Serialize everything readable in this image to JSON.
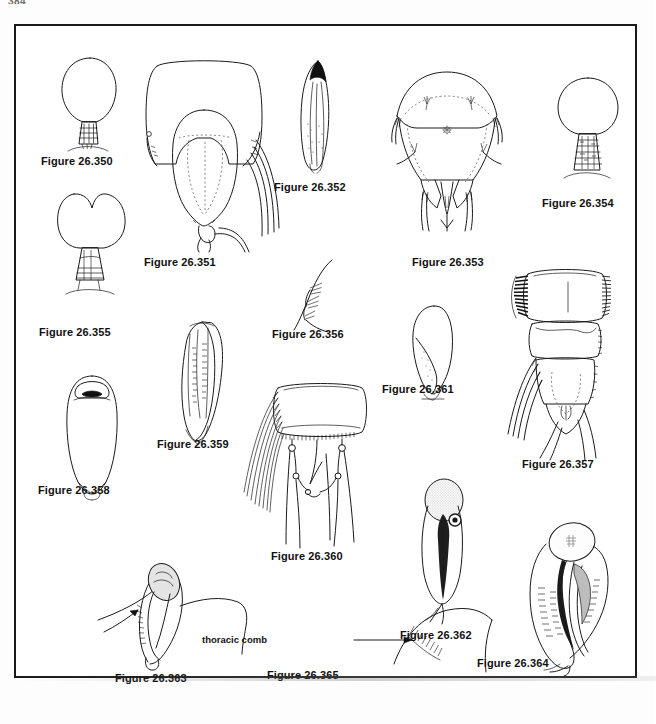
{
  "page": {
    "folio": "384",
    "background_color": "#ffffff",
    "frame_color": "#1a1a1a",
    "ink_color": "#1a1a1a"
  },
  "plate": {
    "type": "scientific-figure-plate",
    "subject": "insect (mosquito) anatomical line drawings",
    "figure_count": 16,
    "figures": [
      {
        "id": "26.350",
        "caption": "Figure 26.350",
        "subject": "stippled pyriform scale with banded stalk"
      },
      {
        "id": "26.351",
        "caption": "Figure 26.351",
        "subject": "terminal abdominal segments with cercal setae"
      },
      {
        "id": "26.352",
        "caption": "Figure 26.352",
        "subject": "elongate lanceolate appendage with dark apex"
      },
      {
        "id": "26.353",
        "caption": "Figure 26.353",
        "subject": "broad terminal plate with paired spines"
      },
      {
        "id": "26.354",
        "caption": "Figure 26.354",
        "subject": "globose stippled head on annulate stalk"
      },
      {
        "id": "26.355",
        "caption": "Figure 26.355",
        "subject": "bilobed (heart-shaped) stippled structure on stalk"
      },
      {
        "id": "26.356",
        "caption": "Figure 26.356",
        "subject": "marginal setal comb detail"
      },
      {
        "id": "26.357",
        "caption": "Figure 26.357",
        "subject": "abdominal segments with lateral comb and caudal setae"
      },
      {
        "id": "26.358",
        "caption": "Figure 26.358",
        "subject": "elongate ovoid body with dark apical cap"
      },
      {
        "id": "26.359",
        "caption": "Figure 26.359",
        "subject": "curved sclerotized plate with internal markings"
      },
      {
        "id": "26.360",
        "caption": "Figure 26.360",
        "subject": "terminal segment with long lateral setal fringe"
      },
      {
        "id": "26.361",
        "caption": "Figure 26.361",
        "subject": "paddle-shaped appendage"
      },
      {
        "id": "26.362",
        "caption": "Figure 26.362",
        "subject": "pupal stage with stippled cephalothorax"
      },
      {
        "id": "26.363",
        "caption": "Figure 26.363",
        "subject": "lateral view of pupa on substrate"
      },
      {
        "id": "26.364",
        "caption": "Figure 26.364",
        "subject": "curved stippled pupa with dark trunk"
      },
      {
        "id": "26.365",
        "caption": "Figure 26.365",
        "subject": "thorax margin showing thoracic comb"
      }
    ],
    "annotations": [
      {
        "id": "thoracic-comb",
        "label": "thoracic comb",
        "for_figure": "26.365"
      }
    ]
  }
}
